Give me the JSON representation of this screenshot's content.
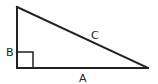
{
  "diagram": {
    "labels": {
      "a": "A",
      "b": "B",
      "c": "C"
    },
    "stroke_color": "#222222",
    "background": "#ffffff",
    "vertices": {
      "top": [
        17,
        7
      ],
      "right_angle": [
        17,
        68
      ],
      "far": [
        148,
        68
      ]
    },
    "right_angle_marker_size": 16
  }
}
